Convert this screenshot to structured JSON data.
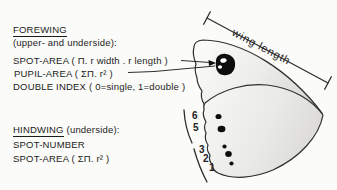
{
  "palette": {
    "ink": "#1b1b1b",
    "outline": "#2e2e2e",
    "spot_black": "#0d0d0d",
    "wing_light": "#fdfdfc",
    "wing_shade": "#d8d7d4"
  },
  "forewing_section": {
    "title": "FOREWING",
    "subtitle": "(upper- and underside):",
    "spot_area": "SPOT-AREA ( Π. r width . r length )",
    "pupil_area": "PUPIL-AREA ( ΣΠ. r² )",
    "double_index": "DOUBLE INDEX ( 0=single, 1=double )"
  },
  "hindwing_section": {
    "title": "HINDWING",
    "subtitle": "(underside):",
    "spot_number": "SPOT-NUMBER",
    "spot_area": "SPOT-AREA ( ΣΠ. r² )"
  },
  "wing_diagram": {
    "measurement_label": "wing length",
    "vein_numbers": [
      "6",
      "5",
      "3",
      "2",
      "1"
    ]
  }
}
